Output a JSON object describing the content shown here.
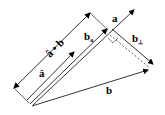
{
  "diagram": {
    "labels": {
      "a": "a",
      "b": "b",
      "b_parallel": "b",
      "b_parallel_sub": "a",
      "b_perp": "b",
      "b_perp_sub": "⊥",
      "a_hat": "â",
      "dot_product": "â • b"
    },
    "colors": {
      "stroke": "#000000",
      "background": "#ffffff"
    }
  }
}
